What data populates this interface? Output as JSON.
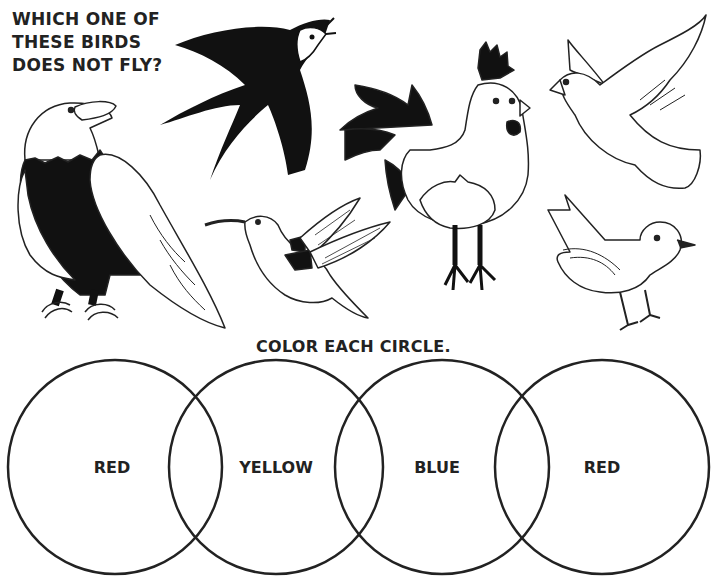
{
  "worksheet": {
    "question_lines": [
      "WHICH ONE OF",
      "THESE BIRDS",
      "DOES NOT FLY?"
    ],
    "instruction": "COLOR EACH CIRCLE.",
    "birds": [
      {
        "name": "eagle",
        "color": "black-white"
      },
      {
        "name": "swallow",
        "color": "black"
      },
      {
        "name": "hummingbird",
        "color": "outline"
      },
      {
        "name": "rooster",
        "color": "outline"
      },
      {
        "name": "dove",
        "color": "outline"
      },
      {
        "name": "songbird",
        "color": "outline"
      }
    ],
    "circles": [
      {
        "label": "RED",
        "cx": 115,
        "cy": 467,
        "r": 107
      },
      {
        "label": "YELLOW",
        "cx": 276,
        "cy": 467,
        "r": 107
      },
      {
        "label": "BLUE",
        "cx": 442,
        "cy": 467,
        "r": 107
      },
      {
        "label": "RED",
        "cx": 602,
        "cy": 467,
        "r": 107
      }
    ],
    "colors": {
      "ink": "#222222",
      "paper": "#ffffff"
    }
  }
}
